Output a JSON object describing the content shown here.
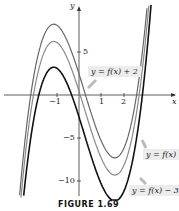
{
  "chart_data": {
    "type": "line",
    "title": "",
    "xlabel": "x",
    "ylabel": "y",
    "xlim": [
      -3.4,
      4.4
    ],
    "ylim": [
      -13,
      11
    ],
    "x_ticks": [
      "-1",
      "1",
      "2"
    ],
    "y_ticks": [
      "5",
      "-5",
      "-10"
    ],
    "series": [
      {
        "name": "y = f(x) + 2",
        "shift": 2,
        "color": "#666666"
      },
      {
        "name": "y = f(x)",
        "shift": 0,
        "color": "#888888"
      },
      {
        "name": "y = f(x) - 3",
        "shift": -3,
        "color": "#111111"
      }
    ],
    "base_function_samples": {
      "x": [
        -2.6,
        -2,
        -1.5,
        -1,
        -0.5,
        0,
        0.5,
        1,
        1.5,
        2,
        2.5,
        3
      ],
      "y": [
        -12,
        -2,
        3,
        4.2,
        2.5,
        -1,
        -4.5,
        -6.8,
        -7.6,
        -6,
        -1,
        8
      ]
    },
    "caption": "FIGURE 1.69"
  },
  "labels": {
    "top": "y = f(x) + 2",
    "mid": "y = f(x)",
    "bottom": "y = f(x) − 3"
  },
  "ticks": {
    "xm1": "−1",
    "x1": "1",
    "x2": "2",
    "y5": "5",
    "ym5": "−5",
    "ym10": "−10",
    "x": "x",
    "y": "y"
  }
}
